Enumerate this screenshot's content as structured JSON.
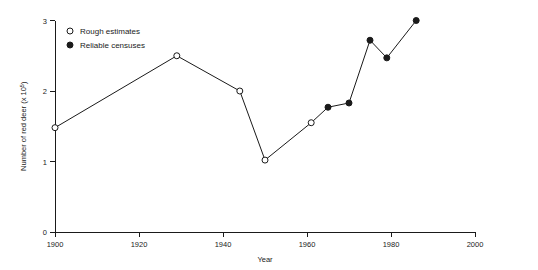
{
  "chart_data": {
    "type": "line",
    "title": "",
    "xlabel": "Year",
    "ylabel": "Number of red deer (x 10⁵)",
    "ylabel_base": "Number of red deer (x 10",
    "ylabel_exponent": "5",
    "ylabel_close": ")",
    "xlim": [
      1900,
      2000
    ],
    "ylim": [
      0,
      3
    ],
    "xticks": [
      1900,
      1920,
      1940,
      1960,
      1980,
      2000
    ],
    "xtick_labels": [
      "1900",
      "1920",
      "1940",
      "1960",
      "1980",
      "2000"
    ],
    "yticks": [
      0,
      1,
      2,
      3
    ],
    "ytick_labels": [
      "0",
      "1",
      "2",
      "3"
    ],
    "grid": false,
    "legend_position": "top-left",
    "line_color": "#1a1a1a",
    "series": [
      {
        "name": "Rough estimates",
        "marker": "open-circle",
        "points": [
          {
            "x": 1900,
            "y": 1.48
          },
          {
            "x": 1929,
            "y": 2.5
          },
          {
            "x": 1944,
            "y": 2.0
          },
          {
            "x": 1950,
            "y": 1.02
          },
          {
            "x": 1961,
            "y": 1.55
          }
        ]
      },
      {
        "name": "Reliable censuses",
        "marker": "filled-circle",
        "points": [
          {
            "x": 1965,
            "y": 1.77
          },
          {
            "x": 1970,
            "y": 1.83
          },
          {
            "x": 1975,
            "y": 2.72
          },
          {
            "x": 1979,
            "y": 2.47
          },
          {
            "x": 1986,
            "y": 3.0
          }
        ]
      }
    ],
    "connected_path": [
      {
        "x": 1900,
        "y": 1.48,
        "marker": "open-circle"
      },
      {
        "x": 1929,
        "y": 2.5,
        "marker": "open-circle"
      },
      {
        "x": 1944,
        "y": 2.0,
        "marker": "open-circle"
      },
      {
        "x": 1950,
        "y": 1.02,
        "marker": "open-circle"
      },
      {
        "x": 1961,
        "y": 1.55,
        "marker": "open-circle"
      },
      {
        "x": 1965,
        "y": 1.77,
        "marker": "filled-circle"
      },
      {
        "x": 1970,
        "y": 1.83,
        "marker": "filled-circle"
      },
      {
        "x": 1975,
        "y": 2.72,
        "marker": "filled-circle"
      },
      {
        "x": 1979,
        "y": 2.47,
        "marker": "filled-circle"
      },
      {
        "x": 1986,
        "y": 3.0,
        "marker": "filled-circle"
      }
    ]
  },
  "legend": {
    "entries": [
      {
        "label": "Rough estimates",
        "marker": "open-circle"
      },
      {
        "label": "Reliable censuses",
        "marker": "filled-circle"
      }
    ]
  }
}
